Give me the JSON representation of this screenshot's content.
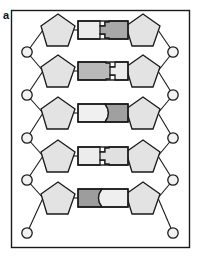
{
  "figure": {
    "panel_label": "a",
    "width": 199,
    "height": 258,
    "border_color": "#1a1a1a",
    "background": "#ffffff"
  },
  "colors": {
    "outline": "#1a1a1a",
    "sugar_fill": "#e3e3e3",
    "base_light": "#ececec",
    "base_medium": "#c9c9c9",
    "base_dark": "#8f8f8f",
    "phosphate_fill": "#f2f2f2",
    "bond_line": "#1a1a1a"
  },
  "legend_names": {
    "sugar": "sugar-pentagon",
    "phosphate": "phosphate-circle",
    "base_left": "base-left-block",
    "base_right": "base-right-block",
    "backbone": "backbone-bond-line",
    "rung": "base-pair-rung"
  },
  "structure": {
    "strand_count": 2,
    "base_pair_count": 5,
    "left_strand_label": "left-strand",
    "right_strand_label": "right-strand"
  },
  "base_pairs": [
    {
      "index": 1,
      "row_y": 30,
      "interface": "puzzle-tab",
      "tab_direction": "right",
      "left_base": {
        "name": "base-left-1",
        "fill": "#ececec",
        "width": 22
      },
      "right_base": {
        "name": "base-right-1",
        "fill": "#a8a8a8",
        "width": 22
      }
    },
    {
      "index": 2,
      "row_y": 71,
      "interface": "puzzle-tab",
      "tab_direction": "left",
      "left_base": {
        "name": "base-left-2",
        "fill": "#b9b9b9",
        "width": 22
      },
      "right_base": {
        "name": "base-right-2",
        "fill": "#ececec",
        "width": 22
      }
    },
    {
      "index": 3,
      "row_y": 113,
      "interface": "curved",
      "tab_direction": "right",
      "left_base": {
        "name": "base-left-3",
        "fill": "#f0f0f0",
        "width": 22
      },
      "right_base": {
        "name": "base-right-3",
        "fill": "#a0a0a0",
        "width": 22
      }
    },
    {
      "index": 4,
      "row_y": 156,
      "interface": "puzzle-tab",
      "tab_direction": "right",
      "left_base": {
        "name": "base-left-4",
        "fill": "#ececec",
        "width": 22
      },
      "right_base": {
        "name": "base-right-4",
        "fill": "#e0e0e0",
        "width": 22
      }
    },
    {
      "index": 5,
      "row_y": 198,
      "interface": "curved",
      "tab_direction": "left",
      "left_base": {
        "name": "base-left-5",
        "fill": "#9d9d9d",
        "width": 22
      },
      "right_base": {
        "name": "base-right-5",
        "fill": "#efefef",
        "width": 22
      }
    }
  ],
  "sugars_left": [
    {
      "index": 1,
      "cx": 58,
      "cy": 30
    },
    {
      "index": 2,
      "cx": 58,
      "cy": 71
    },
    {
      "index": 3,
      "cx": 58,
      "cy": 113
    },
    {
      "index": 4,
      "cx": 58,
      "cy": 156
    },
    {
      "index": 5,
      "cx": 58,
      "cy": 198
    }
  ],
  "sugars_right": [
    {
      "index": 1,
      "cx": 143,
      "cy": 30
    },
    {
      "index": 2,
      "cx": 143,
      "cy": 71
    },
    {
      "index": 3,
      "cx": 143,
      "cy": 113
    },
    {
      "index": 4,
      "cx": 143,
      "cy": 156
    },
    {
      "index": 5,
      "cx": 143,
      "cy": 198
    }
  ],
  "phosphates_left": [
    {
      "index": 1,
      "cx": 27,
      "cy": 52
    },
    {
      "index": 2,
      "cx": 27,
      "cy": 95
    },
    {
      "index": 3,
      "cx": 27,
      "cy": 138
    },
    {
      "index": 4,
      "cx": 27,
      "cy": 180
    },
    {
      "index": 5,
      "cx": 27,
      "cy": 233
    }
  ],
  "phosphates_right": [
    {
      "index": 1,
      "cx": 173,
      "cy": 52
    },
    {
      "index": 2,
      "cx": 173,
      "cy": 95
    },
    {
      "index": 3,
      "cx": 173,
      "cy": 138
    },
    {
      "index": 4,
      "cx": 173,
      "cy": 180
    },
    {
      "index": 5,
      "cx": 173,
      "cy": 233
    }
  ]
}
